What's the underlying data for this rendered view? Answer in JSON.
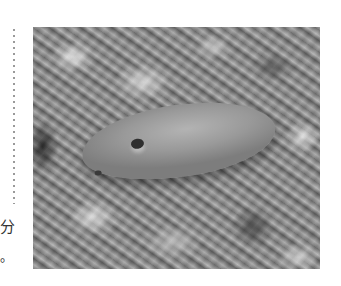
{
  "page": {
    "layout": "book-page-fragment",
    "background_color": "#ffffff"
  },
  "left_margin": {
    "dotted_rule": {
      "color": "#9a9a9a",
      "orientation": "vertical"
    },
    "text_fragments": [
      "分",
      "。"
    ]
  },
  "photo": {
    "description": "Grayscale photograph of a sweet potato lying on leafy ground",
    "subject": "sweet potato",
    "tone": "grayscale"
  }
}
